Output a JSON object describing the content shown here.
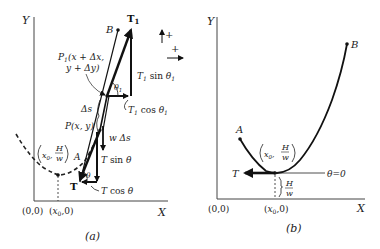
{
  "figure": {
    "panel_a": {
      "caption": "(a)",
      "axis_y": "Y",
      "axis_x": "X",
      "origin": "(0,0)",
      "x0_tick": "(x₀,0)",
      "vertex_label_left": "(x₀, H/w)",
      "vertex_x0": "x₀,",
      "vertex_H": "H",
      "vertex_w": "w",
      "point_A": "A",
      "point_B": "B",
      "point_P": "P(x, y)",
      "point_P1_line1": "P₁(x + Δx,",
      "point_P1_line2": "y + Δy)",
      "delta_s": "Δs",
      "weight": "w Δs",
      "T": "T",
      "T1": "T₁",
      "T_sin": "T sin θ",
      "T_cos": "T cos θ",
      "T1_sin": "T₁ sin θ₁",
      "T1_cos": "T₁ cos θ₁",
      "theta": "θ",
      "theta1": "θ₁",
      "sign_up": "+",
      "sign_right": "+"
    },
    "panel_b": {
      "caption": "(b)",
      "axis_y": "Y",
      "axis_x": "X",
      "origin": "(0,0)",
      "x0_tick": "(x₀,0)",
      "vertex_x0": "x₀,",
      "vertex_H": "H",
      "vertex_w": "w",
      "point_A": "A",
      "point_B": "B",
      "T": "T",
      "theta_zero": "θ=0",
      "height_H": "H",
      "height_w": "w"
    }
  }
}
